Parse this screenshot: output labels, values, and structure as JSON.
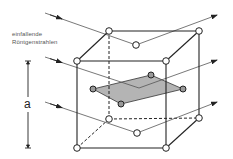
{
  "labels": {
    "incident_line1": "einfallende",
    "incident_line2": "Röntgenstrahlen",
    "lattice_constant": "a"
  },
  "colors": {
    "edge": "#222222",
    "ray": "#555555",
    "plane_fill": "#b4b4b4",
    "node_fill": "#ffffff"
  },
  "cube": {
    "front_top_left": [
      77,
      61
    ],
    "front_top_right": [
      166,
      61
    ],
    "front_bottom_left": [
      77,
      148
    ],
    "front_bottom_right": [
      166,
      148
    ],
    "back_top_left": [
      109,
      31
    ],
    "back_top_right": [
      199,
      31
    ],
    "back_bottom_left": [
      109,
      119
    ],
    "back_bottom_right": [
      199,
      118
    ],
    "top_face_center": [
      136,
      45
    ],
    "bottom_face_center": [
      137,
      133
    ]
  },
  "lattice_plane": {
    "vertices": [
      [
        93,
        89
      ],
      [
        151,
        75
      ],
      [
        183,
        89
      ],
      [
        121,
        104
      ]
    ]
  },
  "rays": [
    {
      "incident_start": [
        45,
        13
      ],
      "reflect_point": [
        136,
        45
      ],
      "exit_end": [
        217,
        15
      ]
    },
    {
      "incident_start": [
        45,
        57
      ],
      "reflect_point": [
        139,
        88
      ],
      "exit_end": [
        217,
        60
      ]
    },
    {
      "incident_start": [
        45,
        102
      ],
      "reflect_point": [
        137,
        133
      ],
      "exit_end": [
        217,
        102
      ]
    }
  ]
}
